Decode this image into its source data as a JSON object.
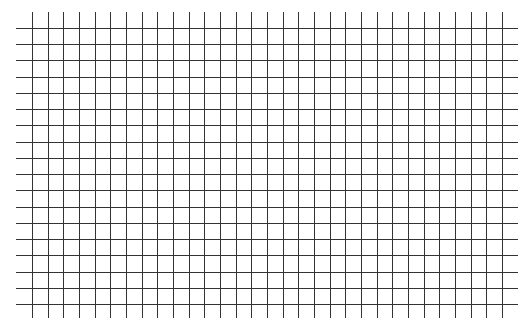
{
  "grid": {
    "background": "#ffffff",
    "line_color": "#333333",
    "vertical": {
      "count": 31,
      "x_start": 32,
      "x_end": 502,
      "y_top": 12,
      "y_bottom": 318
    },
    "horizontal": {
      "count": 18,
      "y_start": 28,
      "y_end": 304,
      "x_left": 16,
      "x_right": 518
    }
  }
}
